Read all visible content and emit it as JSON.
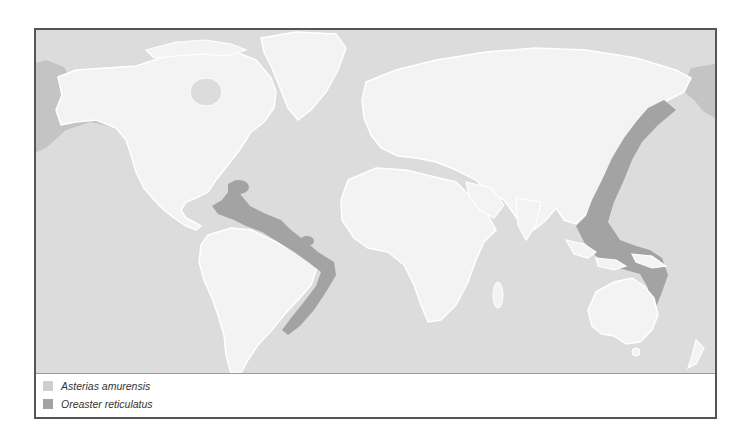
{
  "map": {
    "colors": {
      "ocean": "#dcdcdc",
      "land": "#f3f3f3",
      "coast": "#ffffff",
      "range_asterias": "#cfcfcf",
      "range_oreaster": "#a3a3a3"
    }
  },
  "legend": {
    "items": [
      {
        "label": "Asterias amurensis",
        "color": "#cfcfcf"
      },
      {
        "label": "Oreaster reticulatus",
        "color": "#a3a3a3"
      }
    ]
  }
}
